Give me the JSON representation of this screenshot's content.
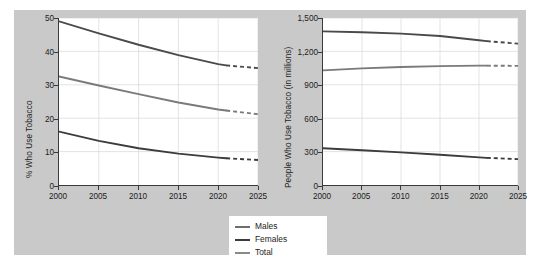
{
  "colors": {
    "panel_background": "#c9c9c9",
    "plot_background": "#ffffff",
    "axis": "#3a3a3a",
    "grid": "#dcdcdc",
    "males": "#4a4a4a",
    "females": "#3c3c3c",
    "total": "#7a7a7a",
    "text": "#1c1c1c"
  },
  "legend": {
    "position": "bottom-center",
    "items": [
      {
        "label": "Males",
        "color": "#6e6e6e",
        "icon": "line-swatch"
      },
      {
        "label": "Females",
        "color": "#3c3c3c",
        "icon": "line-swatch"
      },
      {
        "label": "Total",
        "color": "#8a8a8a",
        "icon": "line-swatch"
      }
    ]
  },
  "chart_data": [
    {
      "id": "left",
      "type": "line",
      "title": "",
      "xlabel": "",
      "ylabel": "% Who Use Tobacco",
      "xlim": [
        2000,
        2025
      ],
      "ylim": [
        0,
        50
      ],
      "xticks": [
        2000,
        2005,
        2010,
        2015,
        2020,
        2025
      ],
      "xticklabels": [
        "2000",
        "2005",
        "2010",
        "2015",
        "2020",
        "2025"
      ],
      "yticks": [
        0,
        10,
        20,
        30,
        40,
        50
      ],
      "yticklabels": [
        "0",
        "10",
        "20",
        "30",
        "40",
        "50"
      ],
      "grid": true,
      "projection_start_year": 2021,
      "series": [
        {
          "name": "Males",
          "color": "#4a4a4a",
          "x": [
            2000,
            2005,
            2010,
            2015,
            2020,
            2021,
            2025
          ],
          "values": [
            49.0,
            45.4,
            42.0,
            38.9,
            36.2,
            35.8,
            35.0
          ],
          "solid_until": 2021
        },
        {
          "name": "Total",
          "color": "#7a7a7a",
          "x": [
            2000,
            2005,
            2010,
            2015,
            2020,
            2021,
            2025
          ],
          "values": [
            32.5,
            29.8,
            27.2,
            24.7,
            22.6,
            22.3,
            21.2
          ],
          "solid_until": 2021
        },
        {
          "name": "Females",
          "color": "#3c3c3c",
          "x": [
            2000,
            2005,
            2010,
            2015,
            2020,
            2021,
            2025
          ],
          "values": [
            16.0,
            13.2,
            11.0,
            9.4,
            8.2,
            8.0,
            7.5
          ],
          "solid_until": 2021
        }
      ]
    },
    {
      "id": "right",
      "type": "line",
      "title": "",
      "xlabel": "",
      "ylabel": "People Who Use Tobacco (in millions)",
      "xlim": [
        2000,
        2025
      ],
      "ylim": [
        0,
        1500
      ],
      "xticks": [
        2000,
        2005,
        2010,
        2015,
        2020,
        2025
      ],
      "xticklabels": [
        "2000",
        "2005",
        "2010",
        "2015",
        "2020",
        "2025"
      ],
      "yticks": [
        0,
        300,
        600,
        900,
        1200,
        1500
      ],
      "yticklabels": [
        "0",
        "300",
        "600",
        "900",
        "1,200",
        "1,500"
      ],
      "grid": true,
      "projection_start_year": 2021,
      "series": [
        {
          "name": "Males",
          "color": "#4a4a4a",
          "x": [
            2000,
            2005,
            2010,
            2015,
            2020,
            2021,
            2025
          ],
          "values": [
            1380,
            1372,
            1360,
            1338,
            1300,
            1292,
            1270
          ],
          "solid_until": 2021
        },
        {
          "name": "Total",
          "color": "#7a7a7a",
          "x": [
            2000,
            2005,
            2010,
            2015,
            2020,
            2021,
            2025
          ],
          "values": [
            1030,
            1048,
            1060,
            1068,
            1072,
            1072,
            1070
          ],
          "solid_until": 2021
        },
        {
          "name": "Females",
          "color": "#3c3c3c",
          "x": [
            2000,
            2005,
            2010,
            2015,
            2020,
            2021,
            2025
          ],
          "values": [
            330,
            312,
            293,
            272,
            248,
            244,
            232
          ],
          "solid_until": 2021
        }
      ]
    }
  ]
}
